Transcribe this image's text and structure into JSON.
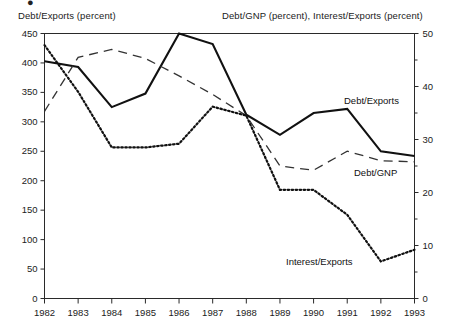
{
  "figure": {
    "top_glyph": "●",
    "left_axis_header": "Debt/Exports (percent)",
    "right_axis_header": "Debt/GNP (percent), Interest/Exports (percent)"
  },
  "chart_data": {
    "type": "line",
    "title": "",
    "subtitle": "",
    "xlabel": "",
    "ylabel": "Debt/Exports (percent)",
    "y2label": "Debt/GNP (percent), Interest/Exports (percent)",
    "grid": false,
    "legend_position": "inline-annotations",
    "x": [
      "1982",
      "1983",
      "1984",
      "1985",
      "1986",
      "1987",
      "1988",
      "1989",
      "1990",
      "1991",
      "1992",
      "1993"
    ],
    "xtick_labels": [
      "1982",
      "1983",
      "1984",
      "1985",
      "1986",
      "1987",
      "1988",
      "1989",
      "1990",
      "1991",
      "1992",
      "1993"
    ],
    "ylim": [
      0,
      450
    ],
    "ytick_labels": [
      "0",
      "50",
      "100",
      "150",
      "200",
      "250",
      "300",
      "350",
      "400",
      "450"
    ],
    "ytick_values": [
      0,
      50,
      100,
      150,
      200,
      250,
      300,
      350,
      400,
      450
    ],
    "y2lim": [
      0,
      50
    ],
    "y2tick_labels": [
      "0",
      "10",
      "20",
      "30",
      "40",
      "50"
    ],
    "y2tick_values": [
      0,
      10,
      20,
      30,
      40,
      50
    ],
    "y2minor_values": [
      5,
      15,
      25,
      35,
      45
    ],
    "series": [
      {
        "name": "Debt/Exports",
        "axis": "left",
        "style": "solid",
        "color": "#111111",
        "label_text": "Debt/Exports",
        "values": [
          403,
          393,
          325,
          348,
          450,
          432,
          312,
          278,
          315,
          322,
          250,
          242
        ]
      },
      {
        "name": "Debt/GNP",
        "axis": "right",
        "style": "dashed",
        "color": "#333333",
        "label_text": "Debt/GNP",
        "values": [
          35.3,
          45.5,
          47.0,
          45.3,
          42.0,
          38.5,
          34.5,
          25.0,
          24.2,
          27.8,
          26.0,
          25.8
        ]
      },
      {
        "name": "Interest/Exports",
        "axis": "right",
        "style": "dotted",
        "color": "#111111",
        "label_text": "Interest/Exports",
        "values": [
          47.8,
          39.0,
          28.5,
          28.5,
          29.2,
          36.2,
          34.5,
          20.5,
          20.5,
          15.8,
          7.0,
          9.2
        ]
      }
    ]
  }
}
